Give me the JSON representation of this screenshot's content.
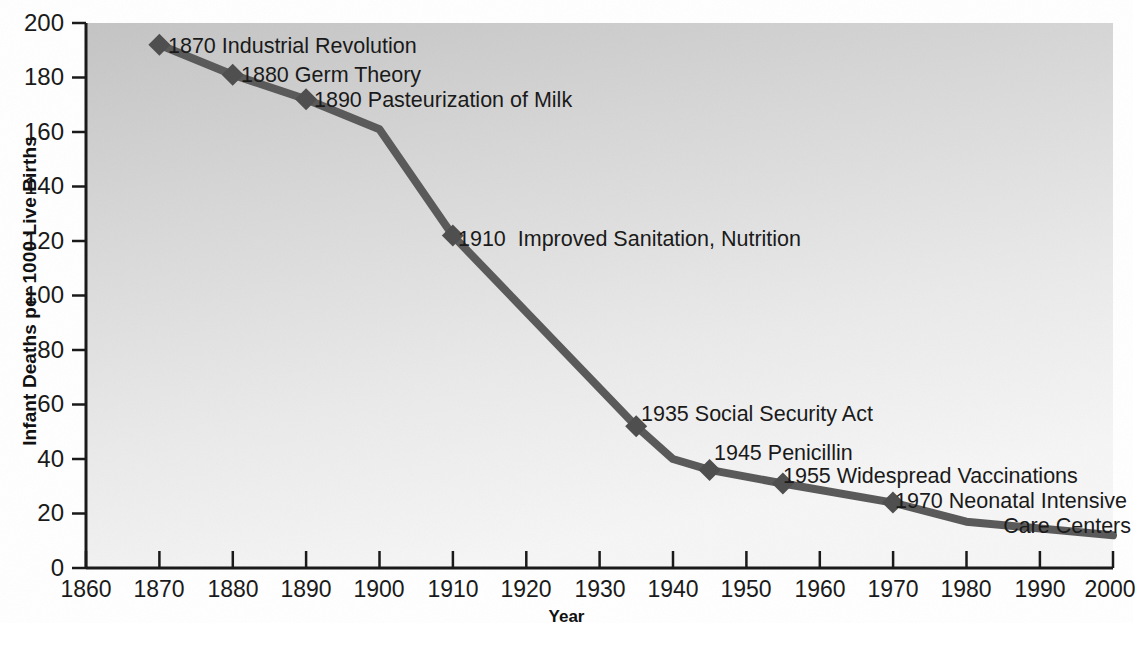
{
  "chart_data": {
    "type": "line",
    "title": "",
    "xlabel": "Year",
    "ylabel": "Infant Deaths per 1000 Live Births",
    "xlim": [
      1860,
      2000
    ],
    "ylim": [
      0,
      200
    ],
    "xticks": [
      1860,
      1870,
      1880,
      1890,
      1900,
      1910,
      1920,
      1930,
      1940,
      1950,
      1960,
      1970,
      1980,
      1990,
      2000
    ],
    "yticks": [
      0,
      20,
      40,
      60,
      80,
      100,
      120,
      140,
      160,
      180,
      200
    ],
    "grid": false,
    "legend": null,
    "series": [
      {
        "name": "Infant mortality rate",
        "x": [
          1870,
          1880,
          1890,
          1900,
          1910,
          1935,
          1940,
          1945,
          1955,
          1970,
          1980,
          2000
        ],
        "values": [
          192,
          181,
          172,
          161,
          122,
          52,
          40,
          36,
          31,
          24,
          17,
          12
        ],
        "marker_points": [
          {
            "x": 1870,
            "y": 192
          },
          {
            "x": 1880,
            "y": 181
          },
          {
            "x": 1890,
            "y": 172
          },
          {
            "x": 1910,
            "y": 122
          },
          {
            "x": 1935,
            "y": 52
          },
          {
            "x": 1945,
            "y": 36
          },
          {
            "x": 1955,
            "y": 31
          },
          {
            "x": 1970,
            "y": 24
          }
        ]
      }
    ],
    "annotations": [
      {
        "id": "a1870",
        "text": "1870 Industrial Revolution"
      },
      {
        "id": "a1880",
        "text": "1880 Germ Theory"
      },
      {
        "id": "a1890",
        "text": "1890 Pasteurization of Milk"
      },
      {
        "id": "a1910",
        "text": "1910  Improved Sanitation, Nutrition"
      },
      {
        "id": "a1935",
        "text": "1935 Social Security Act"
      },
      {
        "id": "a1945",
        "text": "1945 Penicillin"
      },
      {
        "id": "a1955",
        "text": "1955 Widespread Vaccinations"
      },
      {
        "id": "a1970a",
        "text": "1970 Neonatal Intensive"
      },
      {
        "id": "a1970b",
        "text": "Care Centers"
      }
    ],
    "colors": {
      "line": "#5a5a5a",
      "marker": "#4f4f4f",
      "axis": "#1a1a1a",
      "plot_background_top": "#c9c9c9",
      "plot_background_bottom": "#f2f2f2",
      "text": "#1a1a1a"
    }
  },
  "axis": {
    "ylabel": "Infant Deaths per 1000 Live Births",
    "xlabel": "Year",
    "yticks": [
      "200",
      "180",
      "160",
      "140",
      "120",
      "100",
      "80",
      "60",
      "40",
      "20",
      "0"
    ],
    "xticks": [
      "1860",
      "1870",
      "1880",
      "1890",
      "1900",
      "1910",
      "1920",
      "1930",
      "1940",
      "1950",
      "1960",
      "1970",
      "1980",
      "1990",
      "2000"
    ]
  },
  "annotations": {
    "a1870": "1870 Industrial Revolution",
    "a1880": "1880 Germ Theory",
    "a1890": "1890 Pasteurization of Milk",
    "a1910": "1910  Improved Sanitation, Nutrition",
    "a1935": "1935 Social Security Act",
    "a1945": "1945 Penicillin",
    "a1955": "1955 Widespread Vaccinations",
    "a1970a": "1970 Neonatal Intensive",
    "a1970b": "Care Centers"
  }
}
